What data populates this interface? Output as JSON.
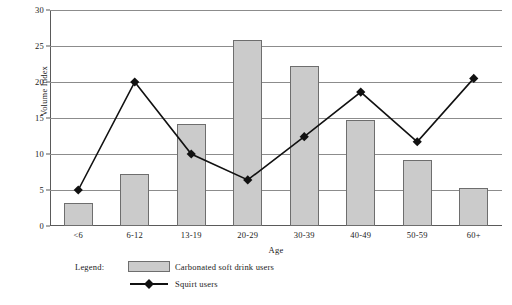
{
  "chart_data": {
    "type": "bar",
    "title": "",
    "xlabel": "Age",
    "ylabel": "Volume Index",
    "categories": [
      "<6",
      "6-12",
      "13-19",
      "20-29",
      "30-39",
      "40-49",
      "50-59",
      "60+"
    ],
    "ylim": [
      0,
      30
    ],
    "yticks": [
      0,
      5,
      10,
      15,
      20,
      25,
      30
    ],
    "ytick_labels": [
      "0",
      "5",
      "10",
      "15",
      "20",
      "25",
      "30"
    ],
    "grid": true,
    "legend_position": "bottom-left",
    "series": [
      {
        "name": "Carbonated soft drink users",
        "render": "bar",
        "color": "#cbcbcb",
        "edge_color": "#6e6e6e",
        "values": [
          3.2,
          7.2,
          14.2,
          25.8,
          22.2,
          14.7,
          9.2,
          5.3
        ]
      },
      {
        "name": "Squirt users",
        "render": "line",
        "color": "#111111",
        "marker": "diamond",
        "values": [
          5.0,
          20.0,
          10.0,
          6.4,
          12.4,
          18.6,
          11.7,
          20.5
        ]
      }
    ]
  },
  "legend": {
    "label": "Legend:",
    "entries": [
      {
        "name": "Carbonated soft drink users",
        "swatch": "bar-swatch"
      },
      {
        "name": "Squirt users",
        "swatch": "line-diamond-swatch"
      }
    ]
  }
}
